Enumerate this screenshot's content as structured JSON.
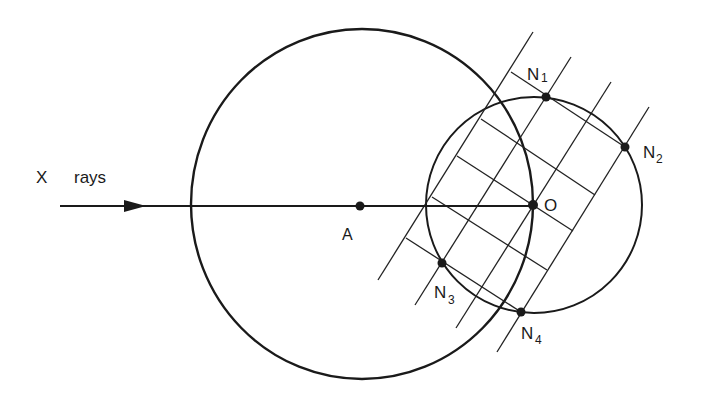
{
  "diagram": {
    "type": "Ewald sphere construction",
    "labels": {
      "xrays_x": "X",
      "xrays_rays": "rays",
      "point_A": "A",
      "point_O": "O",
      "N1": {
        "main": "N",
        "sub": "1"
      },
      "N2": {
        "main": "N",
        "sub": "2"
      },
      "N3": {
        "main": "N",
        "sub": "3"
      },
      "N4": {
        "main": "N",
        "sub": "4"
      }
    },
    "elements": {
      "large_circle": {
        "center": "A",
        "cx": 362,
        "cy": 204,
        "rx": 171,
        "ry": 175
      },
      "small_circle": {
        "center": "O",
        "cx": 534,
        "cy": 205,
        "r": 108
      },
      "beam": {
        "from": [
          60,
          206
        ],
        "to": [
          533,
          206
        ],
        "arrow_at": 145
      },
      "points": {
        "A": [
          360,
          206
        ],
        "O": [
          533,
          205
        ],
        "N1": [
          546,
          96
        ],
        "N2": [
          625,
          147
        ],
        "N3": [
          442,
          263
        ],
        "N4": [
          521,
          312
        ]
      },
      "lattice_lines_steep": [
        [
          [
            533,
            32
          ],
          [
            378,
            280
          ]
        ],
        [
          [
            571,
            57
          ],
          [
            415,
            305
          ]
        ],
        [
          [
            611,
            82
          ],
          [
            456,
            328
          ]
        ],
        [
          [
            649,
            107
          ],
          [
            497,
            352
          ]
        ]
      ],
      "lattice_lines_cross": [
        [
          [
            511,
            72
          ],
          [
            625,
            147
          ]
        ],
        [
          [
            481,
            119
          ],
          [
            595,
            195
          ]
        ],
        [
          [
            457,
            156
          ],
          [
            573,
            231
          ]
        ],
        [
          [
            432,
            197
          ],
          [
            547,
            270
          ]
        ],
        [
          [
            406,
            238
          ],
          [
            521,
            312
          ]
        ]
      ]
    },
    "colors": {
      "ink": "#1a1a1a",
      "background": "#ffffff"
    }
  }
}
